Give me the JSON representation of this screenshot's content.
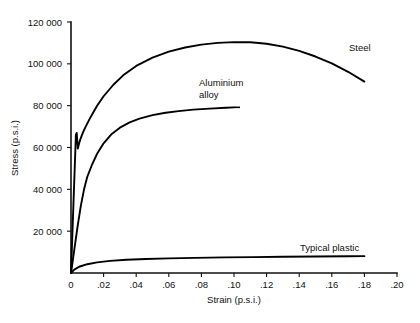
{
  "chart_data": {
    "type": "line",
    "title": "",
    "xlabel": "Strain (p.s.i.)",
    "ylabel": "Stress (p.s.i.)",
    "xlim": [
      0,
      0.2
    ],
    "ylim": [
      0,
      120000
    ],
    "grid": false,
    "legend_position": "inline-annotations",
    "x_ticks": [
      0,
      0.02,
      0.04,
      0.06,
      0.08,
      0.1,
      0.12,
      0.14,
      0.16,
      0.18,
      0.2
    ],
    "x_tick_labels": [
      "0",
      ".02",
      ".04",
      ".06",
      ".08",
      ".10",
      ".12",
      ".14",
      ".16",
      ".18",
      ".20"
    ],
    "y_ticks": [
      20000,
      40000,
      60000,
      80000,
      100000,
      120000
    ],
    "y_tick_labels": [
      "20 000",
      "40 000",
      "60 000",
      "80 000",
      "100 000",
      "120 000"
    ],
    "series": [
      {
        "name": "Steel",
        "label": "Steel",
        "x": [
          0.0,
          0.0015,
          0.003,
          0.0035,
          0.0042,
          0.005,
          0.006,
          0.0075,
          0.009,
          0.012,
          0.016,
          0.02,
          0.026,
          0.032,
          0.04,
          0.05,
          0.06,
          0.07,
          0.08,
          0.09,
          0.1,
          0.11,
          0.12,
          0.13,
          0.14,
          0.15,
          0.16,
          0.17,
          0.18
        ],
        "y": [
          0,
          33000,
          66000,
          67000,
          59500,
          62000,
          64500,
          67500,
          70000,
          74500,
          80000,
          84500,
          90000,
          94500,
          99000,
          103000,
          105800,
          107800,
          109200,
          110000,
          110400,
          110300,
          109600,
          108200,
          106200,
          103500,
          100200,
          96200,
          91500
        ]
      },
      {
        "name": "Aluminium alloy",
        "label_line1": "Aluminium",
        "label_line2": "alloy",
        "x": [
          0.0,
          0.002,
          0.004,
          0.006,
          0.008,
          0.01,
          0.013,
          0.016,
          0.02,
          0.025,
          0.03,
          0.036,
          0.042,
          0.05,
          0.058,
          0.066,
          0.075,
          0.085,
          0.095,
          0.1
        ],
        "y": [
          0,
          11000,
          22000,
          32000,
          40000,
          46000,
          52000,
          57000,
          62000,
          66500,
          69500,
          72000,
          73800,
          75500,
          76600,
          77400,
          78100,
          78600,
          79000,
          79200
        ]
      },
      {
        "name": "Typical plastic",
        "label": "Typical plastic",
        "x": [
          0.0,
          0.002,
          0.005,
          0.01,
          0.016,
          0.024,
          0.034,
          0.046,
          0.06,
          0.076,
          0.094,
          0.112,
          0.13,
          0.15,
          0.17,
          0.18
        ],
        "y": [
          0,
          1600,
          3000,
          4200,
          5100,
          5800,
          6300,
          6700,
          7000,
          7250,
          7450,
          7600,
          7750,
          7900,
          8000,
          8050
        ]
      }
    ]
  },
  "annotations": {
    "steel_label": "Steel",
    "aluminium_label_line1": "Aluminium",
    "aluminium_label_line2": "alloy",
    "plastic_label": "Typical plastic"
  },
  "colors": {
    "curve": "#000000",
    "axis": "#111111",
    "background": "#ffffff"
  }
}
